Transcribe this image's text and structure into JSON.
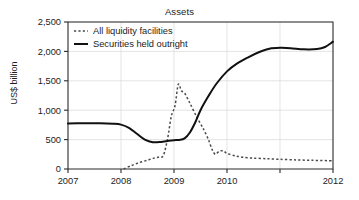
{
  "chart_data": {
    "type": "line",
    "title": "Assets",
    "xlabel": "",
    "ylabel": "US$ billion",
    "xlim": [
      2007.0,
      2012.0
    ],
    "ylim": [
      0,
      2500
    ],
    "xticks": [
      2007,
      2008,
      2009,
      2010,
      2011,
      2012
    ],
    "xtick_labels": [
      "2007",
      "2008",
      "2009",
      "2010",
      "",
      "2012"
    ],
    "yticks": [
      0,
      500,
      1000,
      1500,
      2000,
      2500
    ],
    "ytick_labels": [
      "0",
      "500",
      "1,000",
      "1,500",
      "2,000",
      "2,500"
    ],
    "grid": "vertical-and-horizontal-light",
    "legend_position": "top-left",
    "series": [
      {
        "name": "All liquidity facilities",
        "style": "dotted",
        "color": "#4a4a4a",
        "x": [
          2008.05,
          2008.2,
          2008.35,
          2008.5,
          2008.62,
          2008.72,
          2008.8,
          2008.88,
          2008.95,
          2009.02,
          2009.08,
          2009.14,
          2009.2,
          2009.3,
          2009.42,
          2009.55,
          2009.65,
          2009.72,
          2009.78,
          2009.85,
          2009.93,
          2010.0,
          2010.15,
          2010.3,
          2010.5,
          2010.75,
          2011.0,
          2011.3,
          2011.6,
          2012.0
        ],
        "y": [
          0,
          60,
          110,
          150,
          185,
          205,
          230,
          520,
          900,
          1080,
          1440,
          1330,
          1290,
          1120,
          900,
          690,
          500,
          330,
          250,
          300,
          310,
          265,
          225,
          200,
          185,
          175,
          165,
          155,
          148,
          140
        ]
      },
      {
        "name": "Securities held outright",
        "style": "solid",
        "color": "#111111",
        "x": [
          2007.0,
          2007.3,
          2007.6,
          2007.85,
          2008.0,
          2008.15,
          2008.3,
          2008.45,
          2008.6,
          2008.75,
          2008.9,
          2009.0,
          2009.1,
          2009.2,
          2009.3,
          2009.4,
          2009.5,
          2009.65,
          2009.8,
          2010.0,
          2010.2,
          2010.4,
          2010.6,
          2010.8,
          2011.0,
          2011.2,
          2011.45,
          2011.7,
          2011.85,
          2012.0
        ],
        "y": [
          775,
          778,
          778,
          770,
          755,
          700,
          600,
          500,
          455,
          460,
          480,
          490,
          495,
          520,
          620,
          790,
          1000,
          1240,
          1450,
          1660,
          1800,
          1900,
          1985,
          2045,
          2060,
          2055,
          2035,
          2040,
          2075,
          2165
        ]
      }
    ]
  },
  "legend": {
    "entries": [
      {
        "label": "All liquidity facilities",
        "style": "dotted"
      },
      {
        "label": "Securities held outright",
        "style": "solid"
      }
    ]
  }
}
